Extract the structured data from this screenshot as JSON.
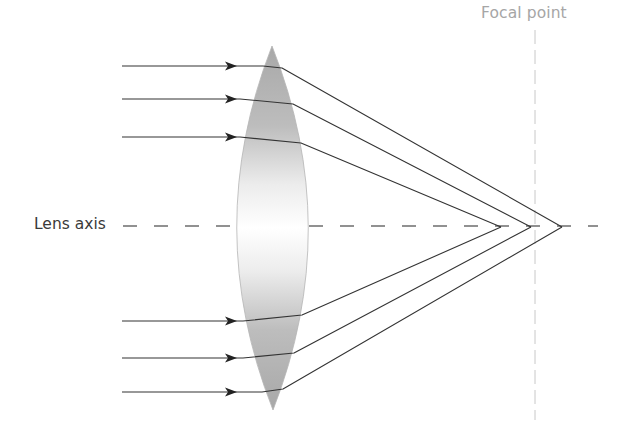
{
  "diagram": {
    "labels": {
      "focal_point": "Focal point",
      "lens_axis": "Lens axis"
    },
    "colors": {
      "ray": "#333333",
      "axis_dash": "#555555",
      "focal_line": "#c8c8c8",
      "lens_edge": "#b5b5b5",
      "lens_fill_edge": "#a8a8a8",
      "lens_fill_center": "#ffffff",
      "focal_label": "#a6a6a6",
      "axis_label": "#3a3a3a"
    },
    "lens": {
      "left_x": 237,
      "right_x": 308,
      "top": [
        272,
        46
      ],
      "bottom": [
        273,
        410
      ]
    },
    "axis": {
      "y": 226,
      "x_start": 123,
      "x_end": 598,
      "dash": 14,
      "gap": 17
    },
    "focal_line": {
      "x": 535,
      "y_start": 30,
      "y_end": 420
    },
    "rays": [
      {
        "id": 1,
        "y": 66,
        "enter_x": 263,
        "exit": [
          282,
          68
        ],
        "focus": [
          562,
          227
        ]
      },
      {
        "id": 2,
        "y": 99,
        "enter_x": 240,
        "exit": [
          293,
          104
        ],
        "focus": [
          531,
          227
        ]
      },
      {
        "id": 3,
        "y": 137,
        "enter_x": 240,
        "exit": [
          301,
          143
        ],
        "focus": [
          501,
          227
        ]
      },
      {
        "id": 4,
        "y": 321,
        "enter_x": 243,
        "exit": [
          302,
          315
        ],
        "focus": [
          501,
          227
        ]
      },
      {
        "id": 5,
        "y": 358,
        "enter_x": 243,
        "exit": [
          294,
          353
        ],
        "focus": [
          531,
          227
        ]
      },
      {
        "id": 6,
        "y": 392,
        "enter_x": 262,
        "exit": [
          283,
          389
        ],
        "focus": [
          562,
          227
        ]
      }
    ],
    "ray_start_x": 122,
    "arrow_x": 234
  }
}
